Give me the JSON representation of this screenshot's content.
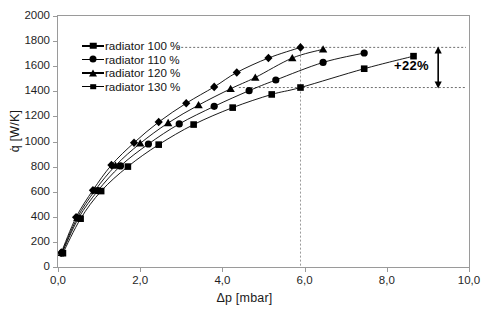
{
  "chart_data": {
    "type": "line",
    "title": "",
    "xlabel": "Δp [mbar]",
    "ylabel": "q̇ [W/K]",
    "xlim": [
      0,
      10
    ],
    "ylim": [
      0,
      2000
    ],
    "xticks": [
      "0,0",
      "2,0",
      "4,0",
      "6,0",
      "8,0",
      "10,0"
    ],
    "xtick_values": [
      0,
      2,
      4,
      6,
      8,
      10
    ],
    "yticks": [
      "0",
      "200",
      "400",
      "600",
      "800",
      "1000",
      "1200",
      "1400",
      "1600",
      "1800",
      "2000"
    ],
    "ytick_values": [
      0,
      200,
      400,
      600,
      800,
      1000,
      1200,
      1400,
      1600,
      1800,
      2000
    ],
    "grid": false,
    "legend_position": "upper left",
    "marker_color": "#000000",
    "line_color": "#000000",
    "frame_color": "#9a9a9a",
    "series": [
      {
        "name": "radiator 100 %",
        "marker": "square",
        "x": [
          0.12,
          0.55,
          1.05,
          1.7,
          2.45,
          3.3,
          4.25,
          5.2,
          5.9,
          7.45,
          8.65
        ],
        "y": [
          110,
          385,
          605,
          800,
          975,
          1135,
          1270,
          1375,
          1430,
          1580,
          1680
        ]
      },
      {
        "name": "radiator 110 %",
        "marker": "circle",
        "x": [
          0.1,
          0.5,
          0.97,
          1.52,
          2.2,
          2.95,
          3.8,
          4.65,
          5.3,
          6.45,
          7.45
        ],
        "y": [
          112,
          390,
          608,
          805,
          980,
          1140,
          1280,
          1405,
          1490,
          1630,
          1705
        ]
      },
      {
        "name": "radiator 120 %",
        "marker": "triangle",
        "x": [
          0.09,
          0.47,
          0.9,
          1.4,
          2.0,
          2.68,
          3.42,
          4.2,
          4.8,
          5.7,
          6.45
        ],
        "y": [
          113,
          393,
          610,
          808,
          985,
          1148,
          1290,
          1420,
          1510,
          1665,
          1735
        ]
      },
      {
        "name": "radiator 130 %",
        "marker": "diamond",
        "x": [
          0.08,
          0.44,
          0.85,
          1.3,
          1.85,
          2.45,
          3.12,
          3.8,
          4.35,
          5.12,
          5.9
        ],
        "y": [
          115,
          396,
          612,
          812,
          990,
          1155,
          1305,
          1435,
          1550,
          1665,
          1750
        ]
      }
    ],
    "annotations": [
      {
        "name": "percent-gain",
        "text": "+22%",
        "type": "double-arrow",
        "x": 9.25,
        "y_from": 1430,
        "y_to": 1750
      }
    ],
    "guide_lines": [
      {
        "name": "vertical-guide",
        "orientation": "vertical",
        "value": 5.9,
        "style": "dashed"
      },
      {
        "name": "upper-guide",
        "orientation": "horizontal",
        "value": 1750,
        "style": "dashed"
      },
      {
        "name": "lower-guide",
        "orientation": "horizontal",
        "value": 1430,
        "style": "dashed"
      }
    ]
  }
}
